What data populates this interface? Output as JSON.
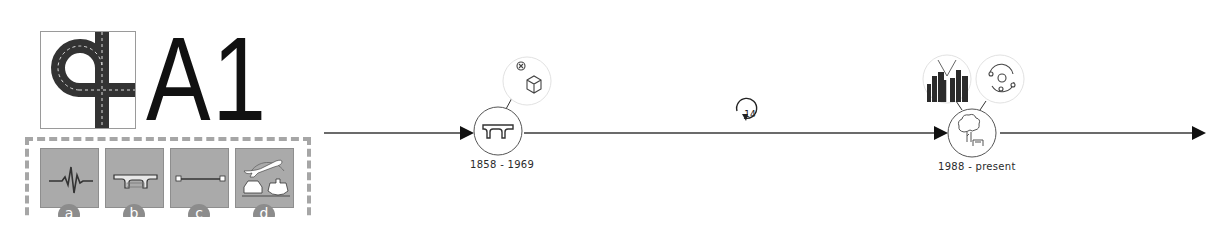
{
  "title": "A1",
  "logo": {
    "icon": "road-interchange-icon"
  },
  "categories": [
    {
      "id": "a",
      "label": "a",
      "icon": "seismic-wave-icon"
    },
    {
      "id": "b",
      "label": "b",
      "icon": "bridge-deck-icon"
    },
    {
      "id": "c",
      "label": "c",
      "icon": "span-line-icon"
    },
    {
      "id": "d",
      "label": "d",
      "icon": "transport-modes-icon"
    }
  ],
  "timeline": {
    "colors": {
      "line": "#3a3a3a",
      "node_border": "#555555",
      "bubble_border": "#dddddd",
      "tile": "#aaaaaa",
      "badge": "#8c8c8c"
    },
    "nodes": [
      {
        "date": "1858 - 1969",
        "icon": "bridge-deck-icon",
        "annotations": [
          {
            "icon": "removed-cube-icon"
          }
        ]
      },
      {
        "date": "1988 - present",
        "icon": "tree-park-icon",
        "annotations": [
          {
            "icon": "city-skyline-icon"
          },
          {
            "icon": "orbit-icon"
          }
        ]
      }
    ],
    "gap": {
      "years": "14",
      "icon": "cycle-arrow-icon"
    }
  }
}
